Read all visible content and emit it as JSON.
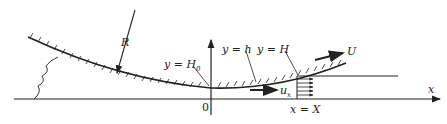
{
  "diagram": {
    "labels": {
      "radius": "R",
      "y_H0": "y = H",
      "y_H0_sub": "0",
      "y_h": "y = h",
      "y_H": "y = H",
      "velocity_U": "U",
      "velocity_ux": "u",
      "velocity_ux_sub": "x",
      "origin": "0",
      "x_axis": "x",
      "x_eq_X": "x = X"
    },
    "colors": {
      "stroke": "#222222",
      "background": "#ffffff"
    }
  }
}
